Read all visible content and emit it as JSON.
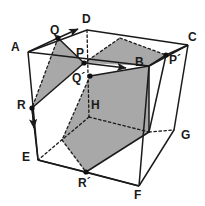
{
  "figure": {
    "canvas": {
      "width": 205,
      "height": 206
    },
    "colors": {
      "background": "#ffffff",
      "stroke": "#1a1a1a",
      "shaded_fill": "#a8a8a8",
      "label_color": "#1a1a1a",
      "dot_color": "#111111"
    },
    "labels": [
      {
        "id": "A",
        "text": "A",
        "x": 11,
        "y": 41
      },
      {
        "id": "Q",
        "text": "Q",
        "x": 50,
        "y": 24
      },
      {
        "id": "D",
        "text": "D",
        "x": 82,
        "y": 13
      },
      {
        "id": "C",
        "text": "C",
        "x": 188,
        "y": 31
      },
      {
        "id": "P",
        "text": "P",
        "x": 76,
        "y": 47
      },
      {
        "id": "B",
        "text": "B",
        "x": 135,
        "y": 56
      },
      {
        "id": "Pp",
        "text": "P´",
        "x": 169,
        "y": 54
      },
      {
        "id": "Qp",
        "text": "Q´",
        "x": 72,
        "y": 72
      },
      {
        "id": "R",
        "text": "R",
        "x": 17,
        "y": 99
      },
      {
        "id": "H",
        "text": "H",
        "x": 91,
        "y": 99
      },
      {
        "id": "G",
        "text": "G",
        "x": 181,
        "y": 129
      },
      {
        "id": "E",
        "text": "E",
        "x": 22,
        "y": 151
      },
      {
        "id": "Rp",
        "text": "R´",
        "x": 78,
        "y": 177
      },
      {
        "id": "F",
        "text": "F",
        "x": 134,
        "y": 189
      }
    ],
    "vertices": {
      "A": {
        "x": 28,
        "y": 52
      },
      "D": {
        "x": 87,
        "y": 30
      },
      "C": {
        "x": 188,
        "y": 45
      },
      "B": {
        "x": 149,
        "y": 66
      },
      "E": {
        "x": 38,
        "y": 160
      },
      "H": {
        "x": 89,
        "y": 117
      },
      "G": {
        "x": 174,
        "y": 130
      },
      "F": {
        "x": 139,
        "y": 186
      },
      "Q": {
        "x": 58,
        "y": 38
      },
      "P": {
        "x": 84,
        "y": 63
      },
      "Qp": {
        "x": 90,
        "y": 76
      },
      "Pp": {
        "x": 166,
        "y": 55
      },
      "R": {
        "x": 32,
        "y": 108
      },
      "Rp": {
        "x": 86,
        "y": 172
      },
      "K": {
        "x": 149,
        "y": 132
      },
      "M": {
        "x": 120,
        "y": 38
      },
      "N": {
        "x": 62,
        "y": 140
      }
    },
    "shapes": {
      "cube_solid_edges": [
        "28,52 87,30",
        "87,30 188,45",
        "188,45 174,130",
        "28,52 38,160",
        "38,160 139,186",
        "139,186 174,130",
        "149,66 149,132",
        "28,52 149,66",
        "149,66 188,45",
        "139,186 149,132"
      ],
      "cube_dashed_edges": [
        "87,30 89,117",
        "89,117 149,132",
        "89,117 38,160",
        "149,132 174,130"
      ],
      "small_left_triangle": "58,38 84,63 32,108",
      "upper_right_band": "120,38 166,55 149,66 84,63",
      "hex_band": "90,76 149,66 149,132 86,172 62,140 62,140",
      "shaded_center": "90,76 149,66 149,132 86,172 62,140"
    },
    "arrows": [
      {
        "id": "arrow-Q-up",
        "from": "58,38",
        "to": "79,30"
      },
      {
        "id": "arrow-P-right",
        "from": "84,63",
        "to": "128,68"
      },
      {
        "id": "arrow-R-down",
        "from": "32,108",
        "to": "34,131"
      }
    ],
    "dots": [
      {
        "id": "dot-Q",
        "x": 58,
        "y": 38
      },
      {
        "id": "dot-P",
        "x": 84,
        "y": 63
      },
      {
        "id": "dot-Qp",
        "x": 90,
        "y": 76
      },
      {
        "id": "dot-Pp",
        "x": 166,
        "y": 55
      },
      {
        "id": "dot-R",
        "x": 32,
        "y": 108
      },
      {
        "id": "dot-Rp",
        "x": 86,
        "y": 172
      }
    ]
  }
}
